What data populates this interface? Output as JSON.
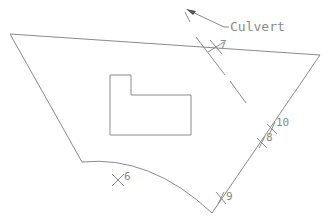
{
  "diagram": {
    "annotation_label": "Culvert",
    "points": [
      {
        "id": "7",
        "label": "7"
      },
      {
        "id": "10",
        "label": "10"
      },
      {
        "id": "8",
        "label": "8"
      },
      {
        "id": "6",
        "label": "6"
      },
      {
        "id": "9",
        "label": "9"
      }
    ],
    "colors": {
      "line": "#8a8a8a",
      "background": "#ffffff"
    }
  }
}
